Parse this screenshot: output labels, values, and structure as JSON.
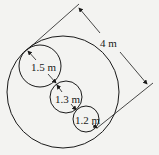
{
  "diagram": {
    "type": "circles-on-diameter",
    "outer_circle": {
      "label": "",
      "diameter_label": "4 m"
    },
    "inner_circles": [
      {
        "label": "1.5 m"
      },
      {
        "label": "1.3 m"
      },
      {
        "label": "1.2 m"
      }
    ],
    "colors": {
      "line": "#1a1a1a",
      "background": "#f3f3f1"
    }
  }
}
